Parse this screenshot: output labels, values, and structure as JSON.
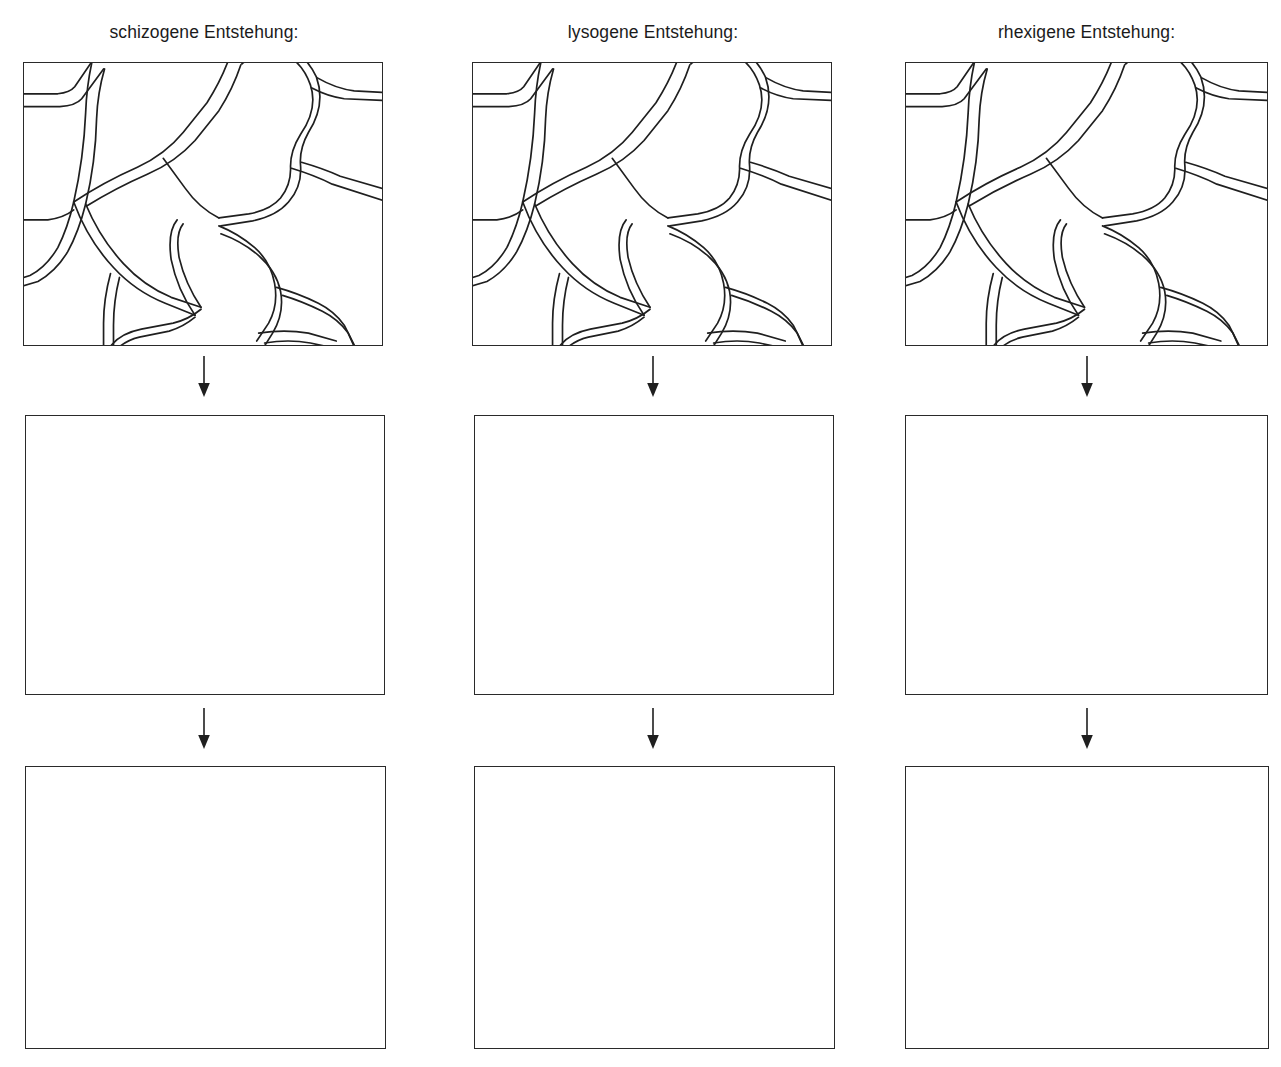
{
  "worksheet": {
    "title_visible": false,
    "columns": [
      {
        "id": "schizogen",
        "label": "schizogene Entstehung:",
        "cell_diagram_name": "plant-tissue-cells-diagram",
        "blank_panel_1_label": "",
        "blank_panel_2_label": ""
      },
      {
        "id": "lysogen",
        "label": "lysogene Entstehung:",
        "cell_diagram_name": "plant-tissue-cells-diagram",
        "blank_panel_1_label": "",
        "blank_panel_2_label": ""
      },
      {
        "id": "rhexigen",
        "label": "rhexigene Entstehung:",
        "cell_diagram_name": "plant-tissue-cells-diagram",
        "blank_panel_1_label": "",
        "blank_panel_2_label": ""
      }
    ],
    "arrow_glyph": "down-arrow",
    "colors": {
      "ink": "#1a1a1a",
      "line": "#2a2a2a",
      "page_background": "#ffffff",
      "panel_background": "#ffffff"
    }
  }
}
